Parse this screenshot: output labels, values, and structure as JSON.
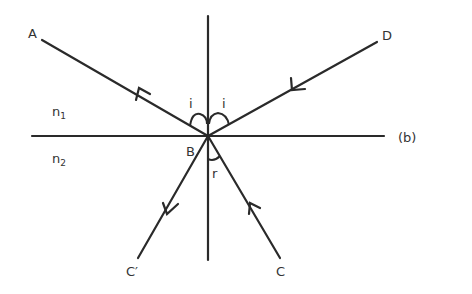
{
  "figure": {
    "panel_label": "(b)",
    "points": {
      "A": "A",
      "B": "B",
      "C": "C",
      "C_prime": "C′",
      "D": "D"
    },
    "media": {
      "upper": {
        "symbol": "n",
        "subscript": "1"
      },
      "lower": {
        "symbol": "n",
        "subscript": "2"
      }
    },
    "angles": {
      "incident_left": "i",
      "incident_right": "i",
      "refracted": "r"
    }
  }
}
